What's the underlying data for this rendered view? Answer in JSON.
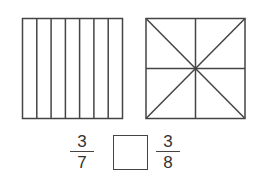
{
  "figures": {
    "left_square": {
      "shape": "square",
      "divisions": 7,
      "division_type": "vertical-strips"
    },
    "right_square": {
      "shape": "square",
      "divisions": 8,
      "division_type": "triangles-from-center"
    }
  },
  "comparison": {
    "left_fraction": {
      "numerator": "3",
      "denominator": "7"
    },
    "answer_box": "",
    "right_fraction": {
      "numerator": "3",
      "denominator": "8"
    }
  },
  "colors": {
    "stroke": "#444444",
    "background": "#ffffff"
  }
}
